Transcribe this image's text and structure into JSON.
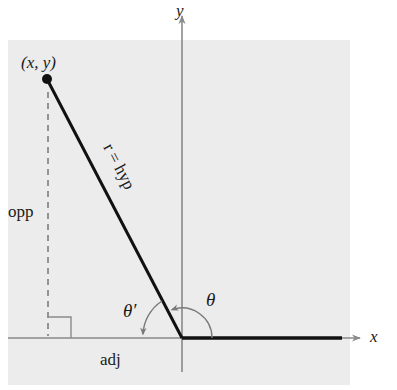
{
  "diagram": {
    "type": "reference-angle-triangle",
    "colors": {
      "panel": "#ececec",
      "axis": "#8a8a8a",
      "hypotenuse": "#111111",
      "dashed": "#777777",
      "text": "#1a1a1a"
    },
    "labels": {
      "point": "(x, y)",
      "y_axis": "y",
      "x_axis": "x",
      "hypotenuse": "r = hyp",
      "opposite": "opp",
      "adjacent": "adj",
      "theta": "θ",
      "theta_prime": "θ′"
    },
    "geometry": {
      "origin": [
        182,
        338
      ],
      "point": [
        47,
        79
      ]
    }
  }
}
